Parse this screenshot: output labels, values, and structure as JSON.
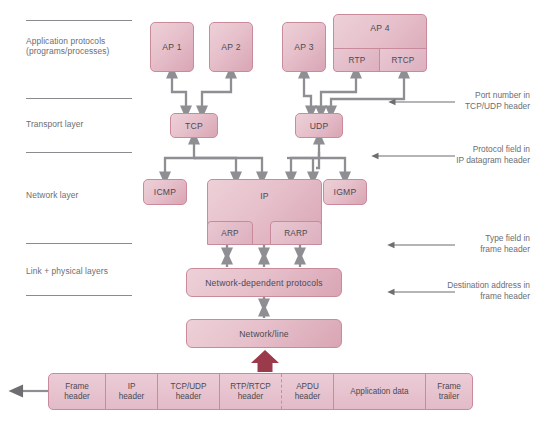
{
  "diagram": {
    "colors": {
      "box_fill_light": "#edd0d8",
      "box_fill_dark": "#d9a5b4",
      "box_border": "#c98b9c",
      "connector": "#8e8e93",
      "rule": "#8a8a8f",
      "text": "#4a4a52",
      "label_text": "#6d6d72",
      "accent_arrow": "#9b3a4a"
    }
  },
  "layers": [
    {
      "id": "application",
      "label": "Application protocols\n(programs/processes)"
    },
    {
      "id": "transport",
      "label": "Transport layer"
    },
    {
      "id": "network",
      "label": "Network layer"
    },
    {
      "id": "link",
      "label": "Link + physical layers"
    }
  ],
  "boxes": {
    "ap1": "AP 1",
    "ap2": "AP 2",
    "ap3": "AP 3",
    "ap4": "AP 4",
    "rtp": "RTP",
    "rtcp": "RTCP",
    "tcp": "TCP",
    "udp": "UDP",
    "icmp": "ICMP",
    "ip": "IP",
    "arp": "ARP",
    "rarp": "RARP",
    "igmp": "IGMP",
    "network_dependent": "Network-dependent protocols",
    "network_line": "Network/line"
  },
  "annotations": [
    {
      "id": "port-number",
      "text": "Port number in\nTCP/UDP header"
    },
    {
      "id": "protocol-field",
      "text": "Protocol field in\nIP datagram header"
    },
    {
      "id": "type-field",
      "text": "Type field in\nframe header"
    },
    {
      "id": "destination-address",
      "text": "Destination address in\nframe header"
    }
  ],
  "frame": {
    "cells": [
      {
        "id": "frame-header",
        "text": "Frame\nheader",
        "width": 57
      },
      {
        "id": "ip-header",
        "text": "IP\nheader",
        "width": 52
      },
      {
        "id": "tcp-udp-header",
        "text": "TCP/UDP\nheader",
        "width": 62
      },
      {
        "id": "rtp-rtcp-header",
        "text": "RTP/RTCP\nheader",
        "width": 62
      },
      {
        "id": "apdu-header",
        "text": "APDU\nheader",
        "width": 52
      },
      {
        "id": "application-data",
        "text": "Application data",
        "width": 92
      },
      {
        "id": "frame-trailer",
        "text": "Frame\ntrailer",
        "width": 46
      }
    ]
  }
}
